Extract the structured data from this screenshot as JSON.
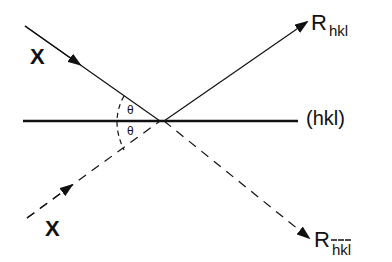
{
  "diagram": {
    "labels": {
      "incident_top": "X",
      "incident_bottom": "X",
      "reflected_top_main": "R",
      "reflected_top_sub": "hkl",
      "reflected_bottom_main": "R",
      "reflected_bottom_sub": "hkl",
      "plane": "(hkl)",
      "theta_top": "θ",
      "theta_bottom": "θ"
    },
    "colors": {
      "line": "#111111",
      "background": "#ffffff"
    }
  }
}
